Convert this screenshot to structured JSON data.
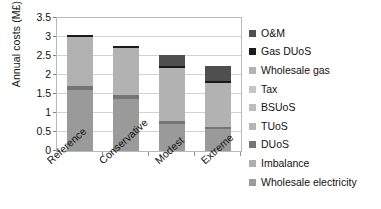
{
  "chart_data": {
    "type": "bar",
    "subtype": "stacked-bar",
    "title": "",
    "xlabel": "",
    "ylabel": "Annual costs (M£)",
    "ylim": [
      0,
      3.5
    ],
    "ytick_labels": [
      "0",
      "0.5",
      "1",
      "1.5",
      "2",
      "2.5",
      "3",
      "3.5"
    ],
    "ytick_values": [
      0,
      0.5,
      1,
      1.5,
      2,
      2.5,
      3,
      3.5
    ],
    "grid": true,
    "grid_axis": "y",
    "legend_position": "right",
    "categories": [
      "Reference",
      "Conservative",
      "Modest",
      "Extreme"
    ],
    "series": [
      {
        "name": "Wholesale electricity",
        "color": "#9a9a9a",
        "values": [
          1.6,
          1.38,
          0.7,
          0.58
        ]
      },
      {
        "name": "Imbalance",
        "color": "#aeaeae",
        "values": [
          0.0,
          0.0,
          0.0,
          0.0
        ]
      },
      {
        "name": "DUoS",
        "color": "#757575",
        "values": [
          0.12,
          0.1,
          0.08,
          0.05
        ]
      },
      {
        "name": "TUoS",
        "color": "#b6b6b6",
        "values": [
          0.0,
          0.0,
          0.0,
          0.0
        ]
      },
      {
        "name": "BSUoS",
        "color": "#bdbdbd",
        "values": [
          0.0,
          0.0,
          0.0,
          0.0
        ]
      },
      {
        "name": "Tax",
        "color": "#c6c6c6",
        "values": [
          0.0,
          0.0,
          0.0,
          0.0
        ]
      },
      {
        "name": "Wholesale gas",
        "color": "#b2b2b2",
        "values": [
          1.28,
          1.24,
          1.4,
          1.17
        ]
      },
      {
        "name": "Gas DUoS",
        "color": "#1a1a1a",
        "values": [
          0.05,
          0.05,
          0.06,
          0.05
        ]
      },
      {
        "name": "O&M",
        "color": "#4f4f4f",
        "values": [
          0.0,
          0.0,
          0.28,
          0.38
        ]
      }
    ],
    "totals": [
      3.05,
      2.77,
      2.52,
      2.23
    ]
  },
  "legend": {
    "items": [
      {
        "label": "O&M",
        "color": "#4f4f4f"
      },
      {
        "label": "Gas DUoS",
        "color": "#1a1a1a"
      },
      {
        "label": "Wholesale gas",
        "color": "#b2b2b2"
      },
      {
        "label": "Tax",
        "color": "#c6c6c6"
      },
      {
        "label": "BSUoS",
        "color": "#bdbdbd"
      },
      {
        "label": "TUoS",
        "color": "#b6b6b6"
      },
      {
        "label": "DUoS",
        "color": "#757575"
      },
      {
        "label": "Imbalance",
        "color": "#aeaeae"
      },
      {
        "label": "Wholesale electricity",
        "color": "#9a9a9a"
      }
    ]
  }
}
